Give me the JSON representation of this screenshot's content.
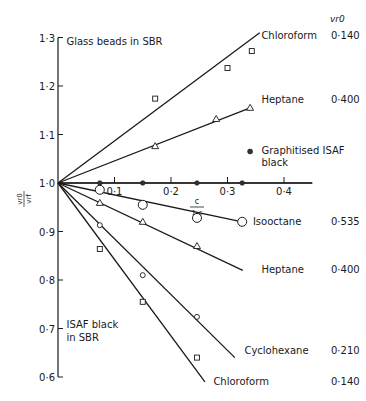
{
  "chart_data": {
    "type": "line",
    "title": "",
    "xlabel": "c / (1-c)",
    "xlabel_num": "c",
    "xlabel_den": "1-c",
    "ylabel_num": "v_r0",
    "ylabel_den": "v_rf",
    "xlim": [
      0,
      0.45
    ],
    "ylim": [
      0.6,
      1.3
    ],
    "grid": false,
    "x_ticks": [
      {
        "value": 0.1,
        "label": "0·1"
      },
      {
        "value": 0.2,
        "label": "0·2"
      },
      {
        "value": 0.3,
        "label": "0·3"
      },
      {
        "value": 0.4,
        "label": "0·4"
      }
    ],
    "y_ticks": [
      {
        "value": 1.3,
        "label": "1·3"
      },
      {
        "value": 1.2,
        "label": "1·2"
      },
      {
        "value": 1.1,
        "label": "1·1"
      },
      {
        "value": 1.0,
        "label": "1·0"
      },
      {
        "value": 0.9,
        "label": "0·9"
      },
      {
        "value": 0.8,
        "label": "0·8"
      },
      {
        "value": 0.7,
        "label": "0·7"
      },
      {
        "value": 0.6,
        "label": "0·6"
      }
    ],
    "vr0_header": "v_r0",
    "annotations": [
      {
        "text": "Glass beads in SBR",
        "x": 0.015,
        "y": 1.285
      },
      {
        "text": "ISAF black",
        "x": 0.015,
        "y": 0.702
      },
      {
        "text": "in SBR",
        "x": 0.015,
        "y": 0.675
      }
    ],
    "series": [
      {
        "name": "Chloroform",
        "group": "Glass beads in SBR",
        "vr0": "0·140",
        "marker": "square",
        "x": [
          0.172,
          0.3,
          0.343
        ],
        "y": [
          1.174,
          1.237,
          1.272
        ],
        "line": [
          [
            0,
            1.0
          ],
          [
            0.357,
            1.31
          ]
        ],
        "label_pos": [
          0.36,
          1.297
        ],
        "vr0_pos": [
          0.49,
          1.297
        ]
      },
      {
        "name": "Heptane",
        "group": "Glass beads in SBR",
        "vr0": "0·400",
        "marker": "triangle",
        "x": [
          0.172,
          0.28,
          0.34
        ],
        "y": [
          1.076,
          1.132,
          1.155
        ],
        "line": [
          [
            0,
            1.0
          ],
          [
            0.34,
            1.155
          ]
        ],
        "label_pos": [
          0.36,
          1.165
        ],
        "vr0_pos": [
          0.49,
          1.165
        ]
      },
      {
        "name": "Graphitised ISAF black",
        "label_line2": "black",
        "label_line1": "Graphitised ISAF",
        "group": "",
        "vr0": "",
        "marker": "dot",
        "x": [
          0.074,
          0.15,
          0.246,
          0.326
        ],
        "y": [
          1.0,
          1.0,
          1.0,
          1.0
        ],
        "line": [
          [
            0,
            1.0
          ],
          [
            0.45,
            1.0
          ]
        ],
        "legend_marker_pos": [
          0.34,
          1.065
        ],
        "label_pos": [
          0.36,
          1.06
        ]
      },
      {
        "name": "Isooctane",
        "group": "ISAF black in SBR",
        "vr0": "0·535",
        "marker": "circle-large",
        "x": [
          0.074,
          0.15,
          0.246,
          0.326
        ],
        "y": [
          0.986,
          0.955,
          0.928,
          0.92
        ],
        "line": [
          [
            0,
            1.0
          ],
          [
            0.326,
            0.92
          ]
        ],
        "label_pos": [
          0.345,
          0.914
        ],
        "vr0_pos": [
          0.49,
          0.914
        ]
      },
      {
        "name": "Heptane",
        "group": "ISAF black in SBR",
        "vr0": "0·400",
        "marker": "triangle",
        "x": [
          0.074,
          0.15,
          0.246
        ],
        "y": [
          0.959,
          0.92,
          0.87
        ],
        "line": [
          [
            0,
            1.0
          ],
          [
            0.327,
            0.82
          ]
        ],
        "label_pos": [
          0.36,
          0.815
        ],
        "vr0_pos": [
          0.49,
          0.815
        ]
      },
      {
        "name": "Cyclohexane",
        "group": "ISAF black in SBR",
        "vr0": "0·210",
        "marker": "circle-small",
        "x": [
          0.074,
          0.15,
          0.246
        ],
        "y": [
          0.913,
          0.81,
          0.724
        ],
        "line": [
          [
            0,
            1.0
          ],
          [
            0.313,
            0.64
          ]
        ],
        "label_pos": [
          0.33,
          0.647
        ],
        "vr0_pos": [
          0.49,
          0.647
        ]
      },
      {
        "name": "Chloroform",
        "group": "ISAF black in SBR",
        "vr0": "0·140",
        "marker": "square",
        "x": [
          0.074,
          0.15,
          0.246
        ],
        "y": [
          0.864,
          0.755,
          0.64
        ],
        "line": [
          [
            0,
            1.0
          ],
          [
            0.26,
            0.59
          ]
        ],
        "label_pos": [
          0.275,
          0.583
        ],
        "vr0_pos": [
          0.49,
          0.583
        ]
      }
    ]
  }
}
